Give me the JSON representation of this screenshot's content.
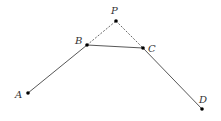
{
  "diagram": {
    "width": 221,
    "height": 121,
    "colors": {
      "stroke": "#444444",
      "point": "#000000",
      "label": "#333333",
      "background": "#ffffff"
    },
    "points": {
      "A": {
        "label": "A",
        "x": 28,
        "y": 93,
        "lx": 15,
        "ly": 98
      },
      "B": {
        "label": "B",
        "x": 87,
        "y": 45,
        "lx": 75,
        "ly": 44
      },
      "P": {
        "label": "P",
        "x": 116,
        "y": 21,
        "lx": 111,
        "ly": 14
      },
      "C": {
        "label": "C",
        "x": 143,
        "y": 48,
        "lx": 148,
        "ly": 52
      },
      "D": {
        "label": "D",
        "x": 202,
        "y": 109,
        "lx": 199,
        "ly": 103
      }
    },
    "segments": [
      {
        "from": "A",
        "to": "B",
        "style": "solid"
      },
      {
        "from": "B",
        "to": "C",
        "style": "solid"
      },
      {
        "from": "C",
        "to": "D",
        "style": "solid"
      },
      {
        "from": "B",
        "to": "P",
        "style": "dashed"
      },
      {
        "from": "P",
        "to": "C",
        "style": "dashed"
      }
    ]
  }
}
